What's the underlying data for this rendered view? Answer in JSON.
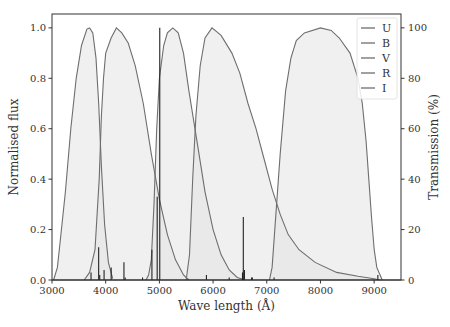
{
  "chart_data": {
    "type": "line",
    "title": "",
    "xlabel": "Wave length (Å)",
    "ylabel": "Normalised flux",
    "ylabel_right": "Transmission (%)",
    "xlim": [
      3000,
      9500
    ],
    "ylim": [
      0,
      1.055
    ],
    "ylim_right": [
      0,
      105.5
    ],
    "x_ticks": [
      3000,
      4000,
      5000,
      6000,
      7000,
      8000,
      9000
    ],
    "x_tick_labels": [
      "3000",
      "4000",
      "5000",
      "6000",
      "7000",
      "8000",
      "9000"
    ],
    "y_ticks": [
      0.0,
      0.2,
      0.4,
      0.6,
      0.8,
      1.0
    ],
    "y_tick_labels": [
      "0.0",
      "0.2",
      "0.4",
      "0.6",
      "0.8",
      "1.0"
    ],
    "y_right_ticks": [
      0,
      20,
      40,
      60,
      80,
      100
    ],
    "y_right_tick_labels": [
      "0",
      "20",
      "40",
      "60",
      "80",
      "100"
    ],
    "grid": false,
    "legend": {
      "placement": "top-right",
      "entries": [
        "U",
        "B",
        "V",
        "R",
        "I"
      ]
    },
    "colors": {
      "curve": "#6e6e6e",
      "fill": "#e4e4e4",
      "spectrum": "#222222",
      "axis": "#333333"
    },
    "series": [
      {
        "name": "U",
        "unit": "transmission %",
        "points": [
          [
            3030,
            0
          ],
          [
            3100,
            5
          ],
          [
            3150,
            15
          ],
          [
            3250,
            35
          ],
          [
            3350,
            60
          ],
          [
            3450,
            80
          ],
          [
            3550,
            93
          ],
          [
            3650,
            99.5
          ],
          [
            3700,
            100
          ],
          [
            3760,
            98
          ],
          [
            3820,
            88
          ],
          [
            3870,
            70
          ],
          [
            3920,
            45
          ],
          [
            3980,
            22
          ],
          [
            4050,
            7
          ],
          [
            4130,
            0.5
          ]
        ]
      },
      {
        "name": "B",
        "unit": "transmission %",
        "points": [
          [
            3600,
            0
          ],
          [
            3700,
            3
          ],
          [
            3800,
            12
          ],
          [
            3880,
            40
          ],
          [
            3920,
            65
          ],
          [
            3960,
            80
          ],
          [
            4000,
            90
          ],
          [
            4100,
            96
          ],
          [
            4200,
            100
          ],
          [
            4300,
            98
          ],
          [
            4420,
            94
          ],
          [
            4550,
            85
          ],
          [
            4700,
            70
          ],
          [
            4850,
            50
          ],
          [
            5000,
            32
          ],
          [
            5150,
            18
          ],
          [
            5300,
            8
          ],
          [
            5450,
            2
          ],
          [
            5550,
            0
          ]
        ]
      },
      {
        "name": "V",
        "unit": "transmission %",
        "points": [
          [
            4750,
            0
          ],
          [
            4800,
            2
          ],
          [
            4850,
            8
          ],
          [
            4900,
            30
          ],
          [
            4950,
            60
          ],
          [
            5000,
            80
          ],
          [
            5080,
            93
          ],
          [
            5150,
            98
          ],
          [
            5250,
            100
          ],
          [
            5350,
            98
          ],
          [
            5450,
            90
          ],
          [
            5550,
            75
          ],
          [
            5700,
            55
          ],
          [
            5850,
            35
          ],
          [
            6000,
            20
          ],
          [
            6150,
            10
          ],
          [
            6300,
            4
          ],
          [
            6450,
            1
          ],
          [
            6600,
            0
          ]
        ]
      },
      {
        "name": "R",
        "unit": "transmission %",
        "points": [
          [
            5500,
            0
          ],
          [
            5560,
            10
          ],
          [
            5620,
            40
          ],
          [
            5680,
            65
          ],
          [
            5760,
            85
          ],
          [
            5850,
            96
          ],
          [
            5980,
            100
          ],
          [
            6150,
            97
          ],
          [
            6350,
            90
          ],
          [
            6500,
            82
          ],
          [
            6650,
            70
          ],
          [
            6800,
            60
          ],
          [
            6950,
            48
          ],
          [
            7100,
            36
          ],
          [
            7250,
            26
          ],
          [
            7400,
            18
          ],
          [
            7600,
            12
          ],
          [
            7900,
            7
          ],
          [
            8300,
            3
          ],
          [
            8700,
            1.5
          ],
          [
            9000,
            0.5
          ],
          [
            9100,
            0
          ]
        ]
      },
      {
        "name": "I",
        "unit": "transmission %",
        "points": [
          [
            7050,
            0
          ],
          [
            7100,
            5
          ],
          [
            7150,
            20
          ],
          [
            7250,
            50
          ],
          [
            7350,
            75
          ],
          [
            7450,
            88
          ],
          [
            7550,
            95
          ],
          [
            7700,
            98
          ],
          [
            8000,
            100
          ],
          [
            8200,
            99
          ],
          [
            8350,
            96
          ],
          [
            8550,
            90
          ],
          [
            8700,
            80
          ],
          [
            8780,
            70
          ],
          [
            8850,
            55
          ],
          [
            8900,
            40
          ],
          [
            8950,
            25
          ],
          [
            9000,
            12
          ],
          [
            9050,
            5
          ],
          [
            9150,
            0
          ]
        ]
      }
    ],
    "spectrum": {
      "name": "Normalised flux",
      "unit": "normalised flux",
      "baseline": 0.0,
      "lines": [
        {
          "wavelength": 3727,
          "flux": 0.03
        },
        {
          "wavelength": 3869,
          "flux": 0.13
        },
        {
          "wavelength": 3889,
          "flux": 0.02
        },
        {
          "wavelength": 3970,
          "flux": 0.04
        },
        {
          "wavelength": 4102,
          "flux": 0.05
        },
        {
          "wavelength": 4340,
          "flux": 0.07
        },
        {
          "wavelength": 4363,
          "flux": 0.01
        },
        {
          "wavelength": 4686,
          "flux": 0.01
        },
        {
          "wavelength": 4861,
          "flux": 0.12
        },
        {
          "wavelength": 4959,
          "flux": 0.33
        },
        {
          "wavelength": 5007,
          "flux": 1.0
        },
        {
          "wavelength": 5876,
          "flux": 0.02
        },
        {
          "wavelength": 6300,
          "flux": 0.01
        },
        {
          "wavelength": 6548,
          "flux": 0.03
        },
        {
          "wavelength": 6563,
          "flux": 0.25
        },
        {
          "wavelength": 6584,
          "flux": 0.04
        },
        {
          "wavelength": 6717,
          "flux": 0.01
        },
        {
          "wavelength": 6731,
          "flux": 0.01
        },
        {
          "wavelength": 7136,
          "flux": 0.01
        },
        {
          "wavelength": 9069,
          "flux": 0.02
        }
      ]
    }
  }
}
